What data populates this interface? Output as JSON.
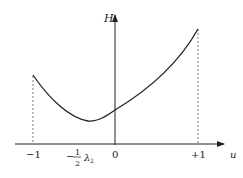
{
  "diagram": {
    "title": "",
    "y_axis_label": "H",
    "x_axis_label": "u",
    "x_ticks": [
      {
        "label": "−1",
        "value": -1
      },
      {
        "label": "0",
        "value": 0
      },
      {
        "label": "+1",
        "value": 1
      }
    ],
    "min_marker": {
      "prefix": "−",
      "numerator": "1",
      "denominator": "2",
      "symbol": "λ",
      "subscript": "2"
    },
    "curve": {
      "description": "convex curve H(u) on [-1, +1], minimum at u = -1/2 λ2",
      "stroke": "#222222"
    },
    "dashed_guides": [
      "u = -1",
      "u = +1"
    ]
  }
}
